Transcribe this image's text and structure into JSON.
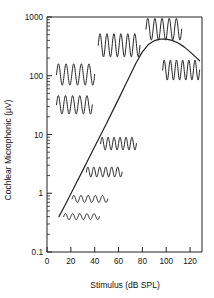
{
  "chart_data": {
    "type": "line",
    "title": "",
    "xlabel": "Stimulus (dB SPL)",
    "ylabel": "Cochlear Microphonic (µV)",
    "xlim": [
      0,
      130
    ],
    "ylim": [
      0.1,
      1000
    ],
    "yscale": "log",
    "xscale": "linear",
    "grid": false,
    "legend": "none",
    "xticks": [
      0,
      20,
      40,
      60,
      80,
      100,
      120
    ],
    "xticklabels": [
      "0",
      "20",
      "40",
      "60",
      "80",
      "100",
      "120"
    ],
    "yticks": [
      0.1,
      1,
      10,
      100,
      1000
    ],
    "yticklabels": [
      "0.1",
      "1",
      "10",
      "100",
      "1000"
    ],
    "minor_ticks": true,
    "series": [
      {
        "name": "Cochlear microphonic input-output function",
        "x": [
          10,
          15,
          20,
          25,
          30,
          35,
          40,
          45,
          50,
          55,
          60,
          65,
          70,
          75,
          80,
          85,
          90,
          95,
          100,
          105,
          110,
          115,
          120,
          125,
          128
        ],
        "y": [
          0.4,
          0.62,
          0.98,
          1.55,
          2.45,
          3.9,
          6.2,
          9.8,
          15.5,
          25,
          40,
          65,
          105,
          170,
          255,
          340,
          395,
          420,
          420,
          400,
          360,
          310,
          255,
          205,
          180
        ]
      }
    ],
    "annotations": [
      {
        "name": "waveform-inset-1",
        "x_start": 14,
        "x_end": 44,
        "y_center": 0.4,
        "amplitude_uv": 0.05,
        "cycles": 5,
        "label": "near-threshold response"
      },
      {
        "name": "waveform-inset-2",
        "x_start": 21,
        "x_end": 51,
        "y_center": 0.8,
        "amplitude_uv": 0.12,
        "cycles": 5,
        "label": "low-level response"
      },
      {
        "name": "waveform-inset-3",
        "x_start": 33,
        "x_end": 63,
        "y_center": 2.3,
        "amplitude_uv": 0.5,
        "cycles": 6,
        "label": "moderate-low response"
      },
      {
        "name": "waveform-inset-4",
        "x_start": 45,
        "x_end": 75,
        "y_center": 7.0,
        "amplitude_uv": 2.0,
        "cycles": 6,
        "label": "mid-level response"
      },
      {
        "name": "waveform-inset-5",
        "x_start": 8,
        "x_end": 38,
        "y_center": 32,
        "amplitude_uv": 14,
        "cycles": 5,
        "label": "growing response"
      },
      {
        "name": "waveform-inset-6",
        "x_start": 8,
        "x_end": 40,
        "y_center": 105,
        "amplitude_uv": 55,
        "cycles": 5,
        "label": "large response"
      },
      {
        "name": "waveform-inset-7",
        "x_start": 43,
        "x_end": 78,
        "y_center": 330,
        "amplitude_uv": 190,
        "cycles": 6,
        "label": "near-saturation response"
      },
      {
        "name": "waveform-inset-8",
        "x_start": 83,
        "x_end": 113,
        "y_center": 620,
        "amplitude_uv": 330,
        "cycles": 5,
        "label": "peak response"
      },
      {
        "name": "waveform-inset-9",
        "x_start": 97,
        "x_end": 128,
        "y_center": 125,
        "amplitude_uv": 60,
        "cycles": 6,
        "label": "post-peak rollover response"
      }
    ],
    "colors": {
      "line": "#222222",
      "axis": "#222222",
      "text": "#111111",
      "background": "#ffffff"
    }
  }
}
